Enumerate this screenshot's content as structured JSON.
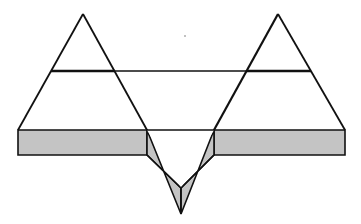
{
  "diagram": {
    "colors": {
      "background": "#ffffff",
      "stroke": "#111111",
      "fill_layer": "#c4c4c4"
    },
    "shapes": {
      "left_peak_apex": [
        83,
        14
      ],
      "right_peak_apex": [
        278,
        14
      ],
      "crest_line_y": 71,
      "bar_top_y": 130,
      "bar_bottom_y": 155,
      "bar_left_x": 18,
      "bar_right_x": 345,
      "v_left_x": 147,
      "v_right_x": 214,
      "v_inner_tip": [
        181,
        188
      ],
      "v_outer_tip": [
        181,
        214
      ]
    }
  }
}
